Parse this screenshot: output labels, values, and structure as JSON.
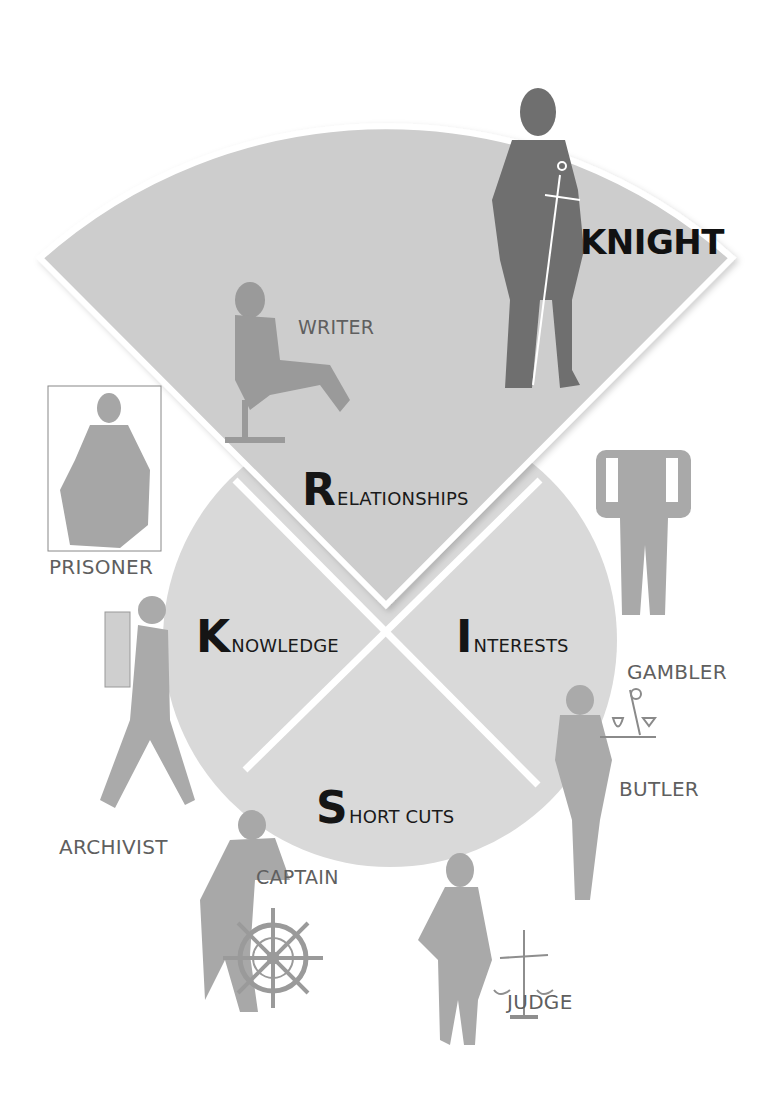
{
  "diagram": {
    "segments": [
      {
        "id": "relationships",
        "initial": "R",
        "rest": "ELATIONSHIPS"
      },
      {
        "id": "knowledge",
        "initial": "K",
        "rest": "NOWLEDGE"
      },
      {
        "id": "interests",
        "initial": "I",
        "rest": "NTERESTS"
      },
      {
        "id": "short_cuts",
        "initial": "S",
        "rest": "HORT CUTS"
      }
    ],
    "roles": {
      "knight": "KNIGHT",
      "writer": "WRITER",
      "prisoner": "PRISONER",
      "gambler": "GAMBLER",
      "archivist": "ARCHIVIST",
      "butler": "BUTLER",
      "captain": "CAPTAIN",
      "judge": "JUDGE"
    },
    "colors": {
      "fan": "#cfcfcf",
      "circle": "#d9d9d9",
      "figure_dark": "#6e6e6e",
      "figure_light": "#a9a9a9",
      "label": "#5f5f5f",
      "heading": "#151515"
    }
  }
}
